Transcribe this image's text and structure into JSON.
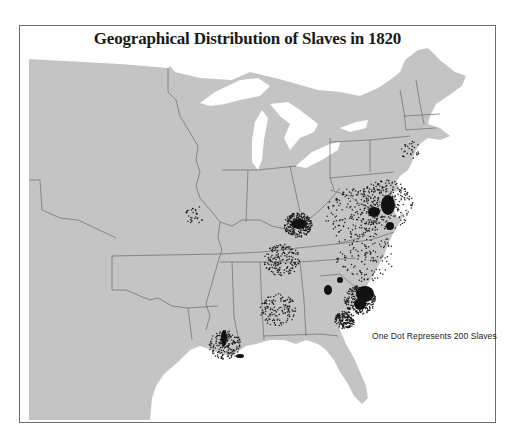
{
  "map": {
    "title": "Geographical Distribution of Slaves in 1820",
    "legend": "One Dot Represents 200 Slaves",
    "colors": {
      "land": "#c4c4c4",
      "water": "#ffffff",
      "border": "#6a6a6a",
      "frame": "#6e6e6e",
      "dot": "#1a1a1a"
    },
    "dot_value": 200,
    "year": 1820,
    "regions_shown": [
      "New England",
      "New York",
      "Pennsylvania",
      "New Jersey",
      "Delaware",
      "Maryland",
      "Virginia",
      "North Carolina",
      "South Carolina",
      "Georgia",
      "Florida",
      "Alabama",
      "Mississippi",
      "Louisiana",
      "Tennessee",
      "Kentucky",
      "Ohio",
      "Indiana",
      "Illinois",
      "Missouri",
      "Arkansas Territory",
      "Michigan Territory",
      "Unorganized territory"
    ],
    "dense_clusters": [
      {
        "name": "Virginia Tidewater / Chesapeake",
        "x": 385,
        "y": 205,
        "r": 28,
        "density": "very-high"
      },
      {
        "name": "Virginia Piedmont",
        "x": 355,
        "y": 215,
        "r": 30,
        "density": "high"
      },
      {
        "name": "Kentucky Bluegrass",
        "x": 298,
        "y": 225,
        "r": 14,
        "density": "very-high"
      },
      {
        "name": "South Carolina Lowcountry",
        "x": 360,
        "y": 300,
        "r": 16,
        "density": "very-high"
      },
      {
        "name": "Georgia Coast",
        "x": 345,
        "y": 320,
        "r": 10,
        "density": "high"
      },
      {
        "name": "Middle Tennessee",
        "x": 282,
        "y": 260,
        "r": 18,
        "density": "high"
      },
      {
        "name": "Lower Mississippi / Louisiana",
        "x": 225,
        "y": 345,
        "r": 16,
        "density": "high"
      },
      {
        "name": "North Carolina",
        "x": 365,
        "y": 255,
        "r": 30,
        "density": "medium"
      },
      {
        "name": "Alabama Black Belt",
        "x": 278,
        "y": 310,
        "r": 18,
        "density": "medium"
      },
      {
        "name": "Missouri River",
        "x": 195,
        "y": 215,
        "r": 10,
        "density": "low"
      },
      {
        "name": "New Jersey / Hudson",
        "x": 410,
        "y": 150,
        "r": 10,
        "density": "low"
      }
    ]
  }
}
